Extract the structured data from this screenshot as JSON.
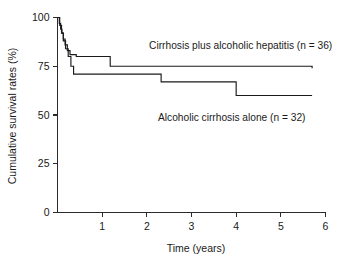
{
  "figure": {
    "background": "#ffffff",
    "ink_color": "#1a1a1a"
  },
  "chart_data": {
    "type": "line",
    "subtype": "kaplan-meier-step",
    "title": "",
    "xlabel": "Time (years)",
    "ylabel": "Cumulative survival rates (%)",
    "xlim": [
      0,
      6
    ],
    "ylim": [
      0,
      100
    ],
    "xticks": [
      0,
      1,
      2,
      3,
      4,
      5,
      6
    ],
    "xticklabels": [
      "0",
      "1",
      "2",
      "3",
      "4",
      "5",
      "6"
    ],
    "yticks": [
      0,
      25,
      50,
      75,
      100
    ],
    "yticklabels": [
      "0",
      "25",
      "50",
      "75",
      "100"
    ],
    "grid": false,
    "legend_position": "inline-annotations",
    "x_axis_visible_origin_label": "0",
    "series": [
      {
        "name": "Cirrhosis plus alcoholic hepatitis (n = 36)",
        "n": 36,
        "color": "#1a1a1a",
        "label_x": 2.05,
        "label_y": 84,
        "label_anchor": "start",
        "final_survival": 74,
        "x": [
          0.0,
          0.04,
          0.07,
          0.1,
          0.13,
          0.17,
          0.22,
          0.28,
          0.34,
          0.42,
          1.18,
          5.7
        ],
        "y": [
          100,
          97,
          94,
          92,
          89,
          86,
          83,
          81,
          81,
          80,
          75,
          74
        ]
      },
      {
        "name": "Alcoholic cirrhosis alone (n = 32)",
        "n": 32,
        "color": "#1a1a1a",
        "label_x": 2.25,
        "label_y": 47,
        "label_anchor": "start",
        "final_survival": 60,
        "x": [
          0.0,
          0.05,
          0.09,
          0.13,
          0.18,
          0.24,
          0.3,
          0.36,
          2.32,
          4.0,
          5.7
        ],
        "y": [
          100,
          96,
          92,
          88,
          84,
          80,
          75,
          71,
          67,
          60,
          60
        ]
      }
    ],
    "annotations": [
      {
        "text": "Cirrhosis plus alcoholic hepatitis (n = 36)",
        "x": 2.05,
        "y": 84
      },
      {
        "text": "Alcoholic cirrhosis alone (n = 32)",
        "x": 2.25,
        "y": 47
      }
    ]
  }
}
